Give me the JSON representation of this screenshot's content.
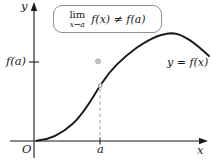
{
  "figure": {
    "formula_box": {
      "lim": "lim",
      "subscript": "x→a",
      "expression": "f(x) ≠ f(a)"
    },
    "labels": {
      "y_axis": "y",
      "x_axis": "x",
      "origin": "O",
      "a_tick": "a",
      "fa_tick": "f(a)",
      "curve": "y = f(x)"
    },
    "colors": {
      "curve": "#1a1a1a",
      "axis": "#1a1a1a",
      "dashed_line": "#9a9a9a",
      "dot_fill": "#c2c2c2",
      "box_border": "#8f8f8f",
      "background": "#ffffff"
    }
  }
}
